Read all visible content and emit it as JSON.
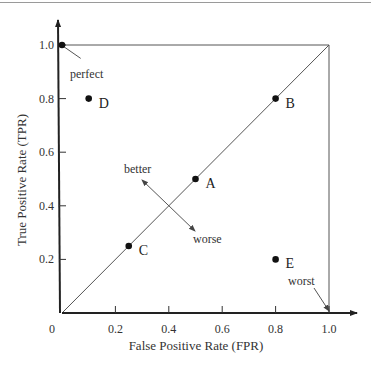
{
  "chart_data": {
    "type": "scatter",
    "title": "",
    "xlabel": "False Positive Rate (FPR)",
    "ylabel": "True Positive Rate (TPR)",
    "xlim": [
      0,
      1.0
    ],
    "ylim": [
      0,
      1.0
    ],
    "grid": false,
    "legend": null,
    "x_ticks": [
      {
        "value": 0,
        "label": "0"
      },
      {
        "value": 0.2,
        "label": "0.2"
      },
      {
        "value": 0.4,
        "label": "0.4"
      },
      {
        "value": 0.6,
        "label": "0.6"
      },
      {
        "value": 0.8,
        "label": "0.8"
      },
      {
        "value": 1.0,
        "label": "1.0"
      }
    ],
    "y_ticks": [
      {
        "value": 0.2,
        "label": "0.2"
      },
      {
        "value": 0.4,
        "label": "0.4"
      },
      {
        "value": 0.6,
        "label": "0.6"
      },
      {
        "value": 0.8,
        "label": "0.8"
      },
      {
        "value": 1.0,
        "label": "1.0"
      }
    ],
    "points": [
      {
        "label": "A",
        "x": 0.5,
        "y": 0.5
      },
      {
        "label": "B",
        "x": 0.8,
        "y": 0.8
      },
      {
        "label": "C",
        "x": 0.25,
        "y": 0.25
      },
      {
        "label": "D",
        "x": 0.1,
        "y": 0.8
      },
      {
        "label": "E",
        "x": 0.8,
        "y": 0.2
      },
      {
        "label": "",
        "x": 0.0,
        "y": 1.0
      }
    ],
    "lines": [
      {
        "name": "random-guess-diagonal",
        "from": [
          0,
          0
        ],
        "to": [
          1,
          1
        ]
      },
      {
        "name": "top-border",
        "from": [
          0,
          1
        ],
        "to": [
          1,
          1
        ]
      },
      {
        "name": "right-border",
        "from": [
          1,
          0
        ],
        "to": [
          1,
          1
        ]
      }
    ],
    "annotations": [
      {
        "text": "perfect",
        "point_to": [
          0.0,
          1.0
        ],
        "text_at": [
          0.1,
          0.93
        ]
      },
      {
        "text": "worst",
        "point_to": [
          1.0,
          0.0
        ],
        "text_at": [
          0.9,
          0.1
        ]
      },
      {
        "text": "better",
        "direction": "up-left",
        "text_at": [
          0.28,
          0.52
        ]
      },
      {
        "text": "worse",
        "direction": "down-right",
        "text_at": [
          0.53,
          0.27
        ]
      }
    ]
  }
}
